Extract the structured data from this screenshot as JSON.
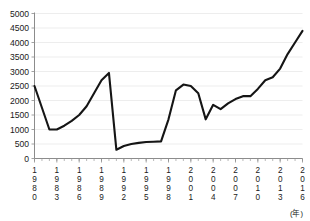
{
  "chart_data": {
    "type": "line",
    "title": "",
    "subtitle": "",
    "xlabel": "(年)",
    "ylabel": "",
    "xlim": [
      1980,
      2016
    ],
    "ylim": [
      0,
      5000
    ],
    "grid": true,
    "legend": null,
    "y_ticks": [
      0,
      500,
      1000,
      1500,
      2000,
      2500,
      3000,
      3500,
      4000,
      4500,
      5000
    ],
    "y_tick_labels": [
      "0",
      "500",
      "1000",
      "1500",
      "2000",
      "2500",
      "3000",
      "3500",
      "4000",
      "4500",
      "5000"
    ],
    "x_ticks": [
      1980,
      1983,
      1986,
      1989,
      1992,
      1995,
      1998,
      2001,
      2004,
      2007,
      2010,
      2013,
      2016
    ],
    "x_tick_labels": [
      "1980",
      "1983",
      "1986",
      "1989",
      "1992",
      "1995",
      "1998",
      "2001",
      "2004",
      "2007",
      "2010",
      "2013",
      "2016"
    ],
    "x_minor_tick_interval": 1,
    "series": [
      {
        "name": "series-1",
        "color": "#151515",
        "x": [
          1980,
          1981,
          1982,
          1983,
          1984,
          1985,
          1986,
          1987,
          1988,
          1989,
          1990,
          1991,
          1992,
          1993,
          1994,
          1995,
          1996,
          1997,
          1998,
          1999,
          2000,
          2001,
          2002,
          2003,
          2004,
          2005,
          2006,
          2007,
          2008,
          2009,
          2010,
          2011,
          2012,
          2013,
          2014,
          2015,
          2016
        ],
        "values": [
          2500,
          1750,
          1000,
          1000,
          1130,
          1300,
          1500,
          1800,
          2250,
          2700,
          2950,
          300,
          430,
          500,
          540,
          570,
          580,
          590,
          1350,
          2350,
          2550,
          2500,
          2250,
          1350,
          1850,
          1700,
          1900,
          2050,
          2150,
          2150,
          2400,
          2700,
          2800,
          3100,
          3600,
          4000,
          4400
        ]
      }
    ]
  },
  "axis": {
    "unit_label": "(年)"
  }
}
